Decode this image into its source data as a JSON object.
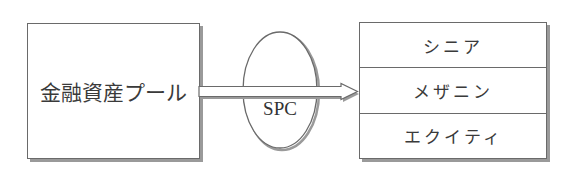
{
  "diagram": {
    "source": {
      "label": "金融資産プール"
    },
    "vehicle": {
      "label": "SPC"
    },
    "tranches": [
      {
        "label": "シニア"
      },
      {
        "label": "メザニン"
      },
      {
        "label": "エクイティ"
      }
    ],
    "colors": {
      "stroke": "#6a6a6a",
      "shadow": "#9a9a9a",
      "text": "#333333",
      "background": "#ffffff"
    }
  }
}
